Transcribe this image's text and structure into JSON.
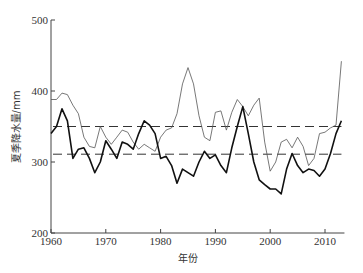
{
  "chart_data": {
    "type": "line",
    "title": "",
    "xlabel": "年份",
    "ylabel": "夏季降水量/mm",
    "xlim": [
      1960,
      2013
    ],
    "ylim": [
      200,
      500
    ],
    "x_ticks": [
      1960,
      1970,
      1980,
      1990,
      2000,
      2010
    ],
    "y_ticks": [
      200,
      300,
      400,
      500
    ],
    "grid": false,
    "legend": null,
    "x": [
      1960,
      1961,
      1962,
      1963,
      1964,
      1965,
      1966,
      1967,
      1968,
      1969,
      1970,
      1971,
      1972,
      1973,
      1974,
      1975,
      1976,
      1977,
      1978,
      1979,
      1980,
      1981,
      1982,
      1983,
      1984,
      1985,
      1986,
      1987,
      1988,
      1989,
      1990,
      1991,
      1992,
      1993,
      1994,
      1995,
      1996,
      1997,
      1998,
      1999,
      2000,
      2001,
      2002,
      2003,
      2004,
      2005,
      2006,
      2007,
      2008,
      2009,
      2010,
      2011,
      2012,
      2013
    ],
    "series": [
      {
        "name": "thin-line",
        "style": "thin",
        "color": "#555555",
        "values": [
          388,
          388,
          397,
          395,
          380,
          368,
          335,
          322,
          320,
          350,
          335,
          325,
          335,
          345,
          342,
          328,
          318,
          325,
          320,
          315,
          335,
          345,
          348,
          368,
          410,
          433,
          410,
          365,
          335,
          330,
          370,
          372,
          345,
          370,
          388,
          378,
          365,
          380,
          390,
          328,
          287,
          300,
          328,
          332,
          320,
          335,
          322,
          295,
          305,
          340,
          342,
          348,
          352,
          442
        ]
      },
      {
        "name": "thick-line",
        "style": "thick",
        "color": "#111111",
        "values": [
          340,
          350,
          375,
          358,
          305,
          318,
          320,
          305,
          285,
          300,
          330,
          318,
          305,
          328,
          325,
          318,
          340,
          358,
          352,
          340,
          305,
          308,
          295,
          270,
          290,
          285,
          280,
          300,
          315,
          305,
          310,
          295,
          285,
          320,
          350,
          378,
          340,
          300,
          275,
          268,
          262,
          262,
          255,
          290,
          312,
          295,
          285,
          290,
          288,
          280,
          290,
          312,
          340,
          358
        ]
      }
    ],
    "reference_lines": [
      {
        "name": "thin-line-mean",
        "value": 350,
        "style": "dashed"
      },
      {
        "name": "thick-line-mean",
        "value": 311,
        "style": "dashed"
      }
    ]
  }
}
